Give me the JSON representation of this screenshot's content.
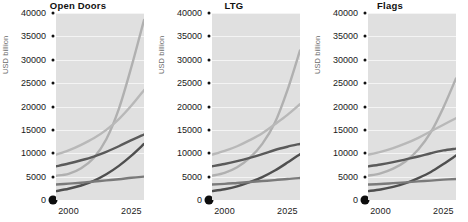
{
  "chart_data": {
    "type": "line",
    "title": "",
    "xlabel": "",
    "ylabel": "USD billion",
    "xlim": [
      1995,
      2030
    ],
    "ylim": [
      0,
      40000
    ],
    "grid": true,
    "legend": "none",
    "x_ticks": [
      "2000",
      "2025"
    ],
    "x_tick_values": [
      2000,
      2025
    ],
    "y_ticks": [
      "0",
      "5000",
      "10000",
      "15000",
      "20000",
      "25000",
      "30000",
      "35000",
      "40000"
    ],
    "y_tick_values": [
      0,
      5000,
      10000,
      15000,
      20000,
      25000,
      30000,
      35000,
      40000
    ],
    "panels": [
      {
        "title": "Open Doors",
        "x": [
          1995,
          2000,
          2005,
          2010,
          2015,
          2020,
          2025,
          2030
        ],
        "series": [
          {
            "name": "series-1",
            "color": "#b0b0b0",
            "values": [
              5200,
              5600,
              6800,
              9000,
              13000,
              19500,
              28500,
              38500
            ]
          },
          {
            "name": "series-2",
            "color": "#b8b8b8",
            "values": [
              9700,
              10600,
              11800,
              13200,
              15000,
              17300,
              20200,
              23500
            ]
          },
          {
            "name": "series-3",
            "color": "#5a5a5a",
            "values": [
              7200,
              7800,
              8500,
              9300,
              10300,
              11500,
              12800,
              14000
            ]
          },
          {
            "name": "series-4",
            "color": "#4f4f4f",
            "values": [
              1900,
              2400,
              3100,
              4100,
              5500,
              7300,
              9500,
              12000
            ]
          },
          {
            "name": "series-5",
            "color": "#7a7a7a",
            "values": [
              3300,
              3500,
              3700,
              3950,
              4200,
              4450,
              4750,
              5000
            ]
          }
        ]
      },
      {
        "title": "LTG",
        "x": [
          1995,
          2000,
          2005,
          2010,
          2015,
          2020,
          2025,
          2030
        ],
        "series": [
          {
            "name": "series-1",
            "color": "#b0b0b0",
            "values": [
              5200,
              5800,
              7000,
              9000,
              12000,
              16500,
              23500,
              32000
            ]
          },
          {
            "name": "series-2",
            "color": "#b8b8b8",
            "values": [
              9700,
              10500,
              11500,
              12800,
              14300,
              16200,
              18200,
              20500
            ]
          },
          {
            "name": "series-3",
            "color": "#5a5a5a",
            "values": [
              7200,
              7700,
              8300,
              9000,
              9800,
              10700,
              11400,
              12000
            ]
          },
          {
            "name": "series-4",
            "color": "#4f4f4f",
            "values": [
              1900,
              2300,
              2900,
              3800,
              4900,
              6300,
              8000,
              9800
            ]
          },
          {
            "name": "series-5",
            "color": "#7a7a7a",
            "values": [
              3300,
              3450,
              3650,
              3850,
              4050,
              4250,
              4500,
              4700
            ]
          }
        ]
      },
      {
        "title": "Flags",
        "x": [
          1995,
          2000,
          2005,
          2010,
          2015,
          2020,
          2025,
          2030
        ],
        "series": [
          {
            "name": "series-1",
            "color": "#b0b0b0",
            "values": [
              5200,
              5700,
              6700,
              8300,
              10800,
              14500,
              19800,
              26000
            ]
          },
          {
            "name": "series-2",
            "color": "#b8b8b8",
            "values": [
              9700,
              10300,
              11100,
              12100,
              13300,
              14700,
              16100,
              17500
            ]
          },
          {
            "name": "series-3",
            "color": "#5a5a5a",
            "values": [
              7200,
              7600,
              8100,
              8700,
              9300,
              10000,
              10600,
              11000
            ]
          },
          {
            "name": "series-4",
            "color": "#4f4f4f",
            "values": [
              1900,
              2250,
              2800,
              3600,
              4700,
              6000,
              7700,
              9500
            ]
          },
          {
            "name": "series-5",
            "color": "#7a7a7a",
            "values": [
              3300,
              3420,
              3600,
              3780,
              3980,
              4150,
              4350,
              4500
            ]
          }
        ]
      }
    ]
  },
  "layout": {
    "panel_top": 13,
    "panel_bottom": 200,
    "panel_left_offset": 56,
    "panel_right_pad": 12
  }
}
